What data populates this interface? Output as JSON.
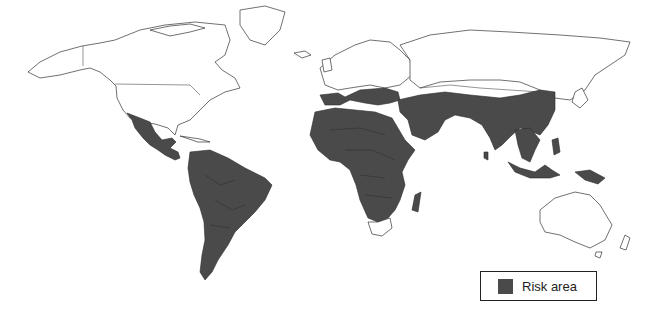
{
  "map": {
    "title": "World map of risk areas",
    "risk_color": "#4a4a4a",
    "land_color": "#ffffff",
    "regions_in_risk_area": [
      "Mexico",
      "Central America",
      "South America",
      "Africa (excluding South Africa)",
      "Madagascar",
      "Southern Europe",
      "Middle East",
      "Central Asia (south)",
      "South Asia",
      "China",
      "Southeast Asia",
      "Indonesia",
      "Philippines",
      "Papua New Guinea"
    ],
    "regions_not_in_risk_area": [
      "Canada",
      "United States",
      "Greenland",
      "Northern Europe",
      "Russia",
      "Mongolia",
      "Japan",
      "Korea",
      "Australia",
      "South Africa"
    ]
  },
  "legend": {
    "label": "Risk area",
    "swatch_color": "#4a4a4a"
  }
}
